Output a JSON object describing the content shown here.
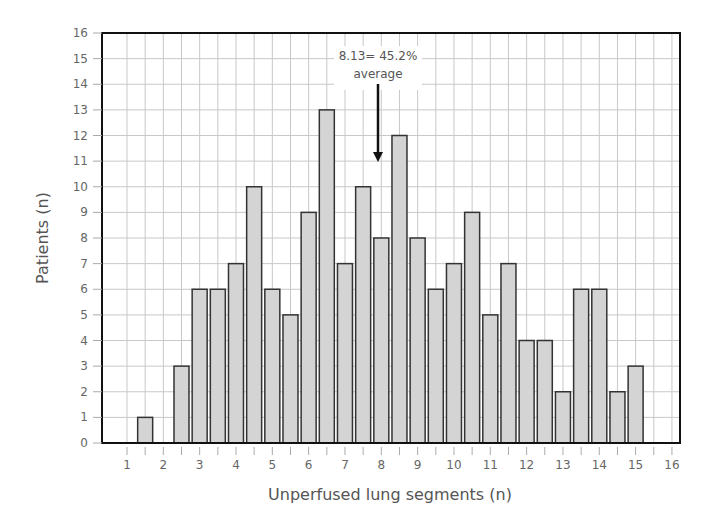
{
  "chart_data": {
    "type": "bar",
    "title": "",
    "xlabel": "Unperfused lung segments (n)",
    "ylabel": "Patients (n)",
    "xlim": [
      0.3,
      16.2
    ],
    "ylim": [
      0,
      16
    ],
    "x_ticks": [
      1,
      2,
      3,
      4,
      5,
      6,
      7,
      8,
      9,
      10,
      11,
      12,
      13,
      14,
      15,
      16
    ],
    "y_ticks": [
      0,
      1,
      2,
      3,
      4,
      5,
      6,
      7,
      8,
      9,
      10,
      11,
      12,
      13,
      14,
      15,
      16
    ],
    "grid": true,
    "x": [
      1.5,
      2.5,
      3,
      3.5,
      4,
      4.5,
      5,
      5.5,
      6,
      6.5,
      7,
      7.5,
      8,
      8.5,
      9,
      9.5,
      10,
      10.5,
      11,
      11.5,
      12,
      12.5,
      13,
      13.5,
      14,
      14.5,
      15
    ],
    "values": [
      1,
      3,
      6,
      6,
      7,
      10,
      6,
      5,
      9,
      13,
      7,
      10,
      8,
      12,
      8,
      6,
      7,
      9,
      5,
      7,
      4,
      4,
      2,
      6,
      6,
      2,
      3
    ],
    "annotations": [
      {
        "text_line1": "8.13= 45.2%",
        "text_line2": "average",
        "x": 8.0,
        "arrow_to_y": 10.6
      }
    ],
    "colors": {
      "bar_fill": "#d4d4d4",
      "bar_edge": "#333333",
      "grid": "#c8c8c8",
      "frame": "#111111"
    }
  }
}
